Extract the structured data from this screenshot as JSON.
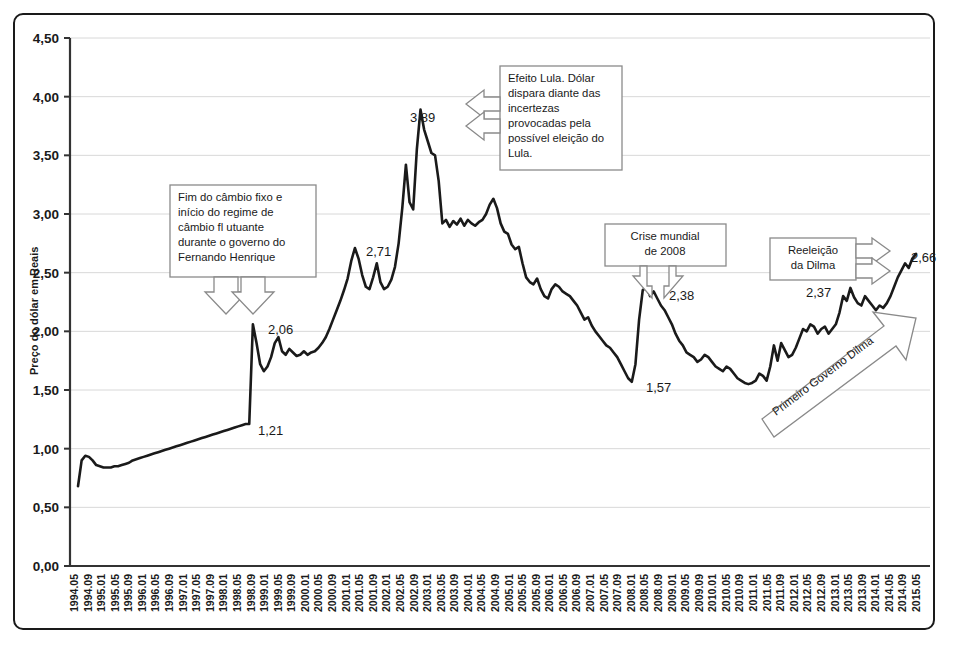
{
  "chart_data": {
    "type": "line",
    "title": "",
    "xlabel": "",
    "ylabel": "Preço do dólar em Reais",
    "ylim": [
      0,
      4.5
    ],
    "ytick_labels": [
      "0,00",
      "0,50",
      "1,00",
      "1,50",
      "2,00",
      "2,50",
      "3,00",
      "3,50",
      "4,00",
      "4,50"
    ],
    "ytick_values": [
      0,
      0.5,
      1.0,
      1.5,
      2.0,
      2.5,
      3.0,
      3.5,
      4.0,
      4.5
    ],
    "grid": true,
    "legend": "none",
    "x_tick_labels": [
      "1994.05",
      "1994.09",
      "1995.01",
      "1995.05",
      "1995.09",
      "1996.01",
      "1996.05",
      "1996.09",
      "1997.01",
      "1997.05",
      "1997.09",
      "1998.01",
      "1998.05",
      "1998.09",
      "1999.01",
      "1999.05",
      "1999.09",
      "2000.01",
      "2000.05",
      "2000.09",
      "2001.01",
      "2001.05",
      "2001.09",
      "2002.01",
      "2002.05",
      "2002.09",
      "2003.01",
      "2003.05",
      "2003.09",
      "2004.01",
      "2004.05",
      "2004.09",
      "2005.01",
      "2005.05",
      "2005.09",
      "2006.01",
      "2006.05",
      "2006.09",
      "2007.01",
      "2007.05",
      "2007.09",
      "2008.01",
      "2008.05",
      "2008.09",
      "2009.01",
      "2009.05",
      "2009.09",
      "2010.01",
      "2010.05",
      "2010.09",
      "2011.01",
      "2011.05",
      "2011.09",
      "2012.01",
      "2012.05",
      "2012.09",
      "2013.01",
      "2013.05",
      "2013.09",
      "2014.01",
      "2014.05",
      "2014.09",
      "2015.05"
    ],
    "x_start": "1994.05",
    "x_end": "2015.05",
    "series": [
      {
        "name": "Preço do dólar em Reais",
        "values": [
          0.68,
          0.9,
          0.94,
          0.93,
          0.9,
          0.86,
          0.85,
          0.84,
          0.84,
          0.84,
          0.85,
          0.85,
          0.86,
          0.87,
          0.88,
          0.9,
          0.91,
          0.92,
          0.93,
          0.94,
          0.95,
          0.96,
          0.97,
          0.98,
          0.99,
          1.0,
          1.01,
          1.02,
          1.03,
          1.04,
          1.05,
          1.06,
          1.07,
          1.08,
          1.09,
          1.1,
          1.11,
          1.12,
          1.13,
          1.14,
          1.15,
          1.16,
          1.17,
          1.18,
          1.19,
          1.2,
          1.21,
          1.21,
          2.06,
          1.9,
          1.72,
          1.66,
          1.7,
          1.78,
          1.9,
          1.95,
          1.83,
          1.8,
          1.85,
          1.82,
          1.79,
          1.8,
          1.83,
          1.8,
          1.82,
          1.83,
          1.86,
          1.9,
          1.95,
          2.02,
          2.1,
          2.18,
          2.26,
          2.35,
          2.45,
          2.6,
          2.71,
          2.62,
          2.48,
          2.38,
          2.36,
          2.46,
          2.58,
          2.42,
          2.36,
          2.38,
          2.44,
          2.55,
          2.75,
          3.05,
          3.42,
          3.1,
          3.04,
          3.55,
          3.89,
          3.72,
          3.62,
          3.52,
          3.5,
          3.28,
          2.92,
          2.95,
          2.89,
          2.94,
          2.91,
          2.96,
          2.9,
          2.95,
          2.92,
          2.9,
          2.93,
          2.95,
          3.0,
          3.08,
          3.13,
          3.05,
          2.92,
          2.85,
          2.83,
          2.74,
          2.7,
          2.72,
          2.58,
          2.46,
          2.42,
          2.4,
          2.45,
          2.36,
          2.3,
          2.28,
          2.36,
          2.4,
          2.38,
          2.34,
          2.32,
          2.3,
          2.26,
          2.22,
          2.16,
          2.1,
          2.12,
          2.05,
          2.0,
          1.96,
          1.92,
          1.88,
          1.86,
          1.82,
          1.78,
          1.72,
          1.66,
          1.6,
          1.57,
          1.72,
          2.1,
          2.35,
          2.38,
          2.3,
          2.34,
          2.28,
          2.22,
          2.18,
          2.12,
          2.06,
          1.98,
          1.92,
          1.88,
          1.82,
          1.8,
          1.78,
          1.74,
          1.76,
          1.8,
          1.78,
          1.74,
          1.7,
          1.68,
          1.66,
          1.7,
          1.68,
          1.64,
          1.6,
          1.58,
          1.56,
          1.55,
          1.56,
          1.58,
          1.64,
          1.62,
          1.58,
          1.7,
          1.88,
          1.75,
          1.9,
          1.84,
          1.78,
          1.8,
          1.86,
          1.94,
          2.02,
          2.0,
          2.06,
          2.04,
          1.98,
          2.02,
          2.04,
          1.98,
          2.02,
          2.06,
          2.16,
          2.3,
          2.26,
          2.37,
          2.29,
          2.24,
          2.22,
          2.3,
          2.26,
          2.22,
          2.18,
          2.22,
          2.2,
          2.24,
          2.3,
          2.38,
          2.46,
          2.52,
          2.58,
          2.54,
          2.62,
          2.66
        ]
      }
    ],
    "point_labels": [
      {
        "label": "1,21",
        "value": 1.21,
        "x_label": "1998.12"
      },
      {
        "label": "2,06",
        "value": 2.06,
        "x_label": "1999.02"
      },
      {
        "label": "2,71",
        "value": 2.71,
        "x_label": "2001.09"
      },
      {
        "label": "3,89",
        "value": 3.89,
        "x_label": "2002.10"
      },
      {
        "label": "2,38",
        "value": 2.38,
        "x_label": "2008.12"
      },
      {
        "label": "1,57",
        "value": 1.57,
        "x_label": "2008.07"
      },
      {
        "label": "2,37",
        "value": 2.37,
        "x_label": "2013.08"
      },
      {
        "label": "2,66",
        "value": 2.66,
        "x_label": "2015.05"
      }
    ],
    "annotations": [
      {
        "id": "fim-cambio-fixo",
        "lines": [
          "Fim do câmbio fixo  e",
          "início do regime de",
          "câmbio fl utuante",
          "durante o governo do",
          "Fernando Henrique"
        ],
        "arrow": "down-double",
        "points_to": "2,06"
      },
      {
        "id": "efeito-lula",
        "lines": [
          "Efeito Lula. Dólar",
          "dispara diante das",
          "incertezas",
          "provocadas pela",
          "possível eleição do",
          "Lula."
        ],
        "arrow": "left-double",
        "points_to": "3,89"
      },
      {
        "id": "crise-mundial",
        "lines": [
          "Crise mundial",
          "de 2008"
        ],
        "arrow": "down-double",
        "points_to": "2,38"
      },
      {
        "id": "reeleicao-dilma",
        "lines": [
          "Reeleição",
          "da Dilma"
        ],
        "arrow": "right-double",
        "points_to": "2,66"
      },
      {
        "id": "primeiro-governo-dilma",
        "lines": [
          "Primeiro Governo Dilma"
        ],
        "arrow": "diagonal-up-right",
        "points_to": ""
      }
    ],
    "colors": {
      "line": "#1a1a1a",
      "grid": "#d8d8d8",
      "axis": "#333333",
      "frame": "#1a1a1a",
      "annotation_border": "#808080",
      "background": "#ffffff"
    }
  }
}
